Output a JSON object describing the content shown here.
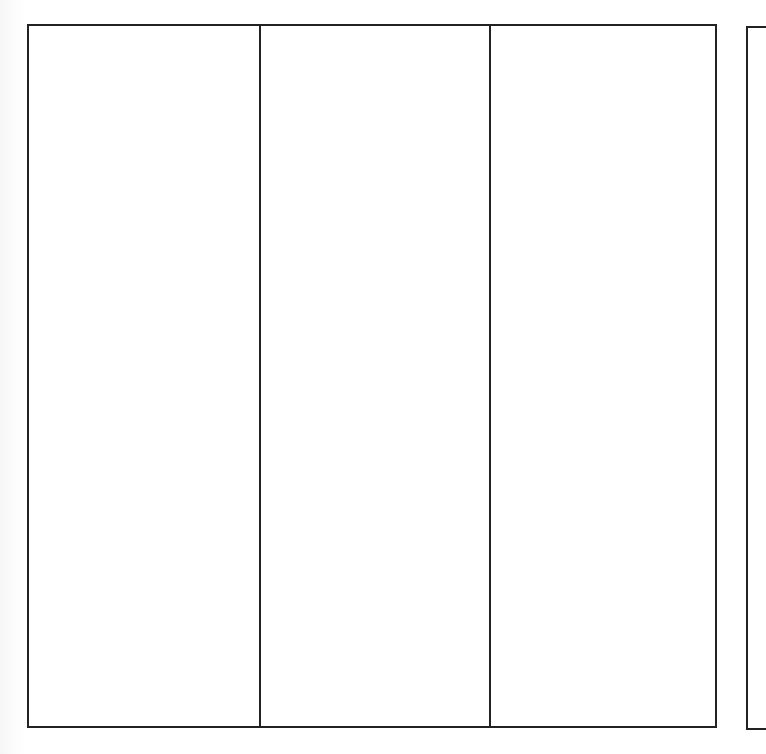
{
  "diagram": {
    "type": "three-column blank grid",
    "frame": {
      "stroke_color": "#222222",
      "background": "#ffffff"
    },
    "columns": [
      {
        "label": ""
      },
      {
        "label": ""
      },
      {
        "label": ""
      }
    ],
    "adjacent_frame_partial": true
  }
}
